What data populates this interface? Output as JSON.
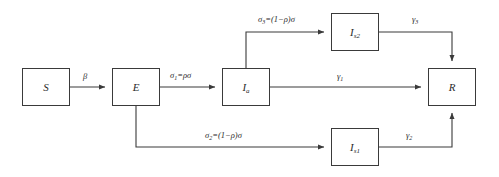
{
  "diagram": {
    "type": "flow-diagram",
    "background_color": "#ffffff",
    "stroke_color": "#3a3a3a",
    "text_color": "#2b2b2b"
  },
  "nodes": [
    {
      "id": "S",
      "label": "S",
      "sub": "",
      "x": 22,
      "y": 68,
      "w": 48,
      "h": 38
    },
    {
      "id": "E",
      "label": "E",
      "sub": "",
      "x": 112,
      "y": 68,
      "w": 48,
      "h": 38
    },
    {
      "id": "Ia",
      "label": "I",
      "sub": "a",
      "x": 222,
      "y": 68,
      "w": 48,
      "h": 38
    },
    {
      "id": "Is2",
      "label": "I",
      "sub": "s2",
      "x": 331,
      "y": 13,
      "w": 48,
      "h": 38
    },
    {
      "id": "Is1",
      "label": "I",
      "sub": "s1",
      "x": 331,
      "y": 128,
      "w": 48,
      "h": 38
    },
    {
      "id": "R",
      "label": "R",
      "sub": "",
      "x": 428,
      "y": 68,
      "w": 48,
      "h": 38
    }
  ],
  "edges": [
    {
      "id": "S-to-E",
      "from": "S",
      "to": "E",
      "label": "β",
      "label_sub": "",
      "label_x": 83,
      "label_y": 72
    },
    {
      "id": "E-to-Ia",
      "from": "E",
      "to": "Ia",
      "label": "σ",
      "label_sub": "1",
      "label_rest": "=ρσ",
      "label_x": 170,
      "label_y": 71
    },
    {
      "id": "Ia-to-Is2",
      "from": "Ia",
      "to": "Is2",
      "label": "σ",
      "label_sub": "3",
      "label_rest": "=(1−ρ)σ",
      "label_x": 258,
      "label_y": 15
    },
    {
      "id": "E-to-Is1",
      "from": "E",
      "to": "Is1",
      "label": "σ",
      "label_sub": "2",
      "label_rest": "=(1−ρ)σ",
      "label_x": 205,
      "label_y": 131
    },
    {
      "id": "Ia-to-R",
      "from": "Ia",
      "to": "R",
      "label": "γ",
      "label_sub": "1",
      "label_x": 337,
      "label_y": 72
    },
    {
      "id": "Is2-to-R",
      "from": "Is2",
      "to": "R",
      "label": "γ",
      "label_sub": "3",
      "label_x": 412,
      "label_y": 15
    },
    {
      "id": "Is1-to-R",
      "from": "Is1",
      "to": "R",
      "label": "γ",
      "label_sub": "2",
      "label_x": 406,
      "label_y": 131
    }
  ]
}
